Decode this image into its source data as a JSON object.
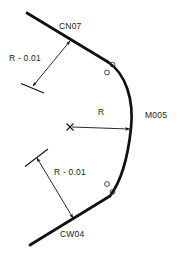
{
  "drawing": {
    "title": "tangent-arc-radius-dimension-diagram",
    "stroke_color": "#111111",
    "background_color": "#ffffff",
    "thick_stroke_width": 2.6,
    "thin_stroke_width": 0.9,
    "labels": {
      "upper_tangent_point": "CN07",
      "lower_tangent_point": "CW04",
      "arc_apex": "M005",
      "radius": "R",
      "radius_minus_upper": "R - 0.01",
      "radius_minus_lower": "R - 0.01"
    },
    "geometry": {
      "upper_line_start": [
        27,
        13
      ],
      "upper_line_end": [
        108,
        62
      ],
      "lower_line_start": [
        30,
        245
      ],
      "lower_line_end": [
        110,
        196
      ],
      "arc_apex_point": [
        131,
        128
      ],
      "arc_center_mark": [
        70,
        127
      ],
      "radius_arrow_start": [
        76,
        127
      ],
      "radius_arrow_end": [
        130,
        129
      ],
      "upper_leader_from": [
        70,
        40
      ],
      "upper_leader_to": [
        32,
        87
      ],
      "lower_leader_from": [
        73,
        219
      ],
      "lower_leader_to": [
        36,
        157
      ],
      "upper_witness_dash": [
        [
          21,
          84
        ],
        [
          44,
          93
        ]
      ],
      "lower_witness_dash": [
        [
          25,
          166
        ],
        [
          48,
          150
        ]
      ],
      "arc_markers_upper": [
        [
          112,
          64
        ],
        [
          107,
          72
        ]
      ],
      "arc_markers_lower": [
        [
          107,
          184
        ],
        [
          112,
          192
        ]
      ],
      "marker_radius": 2.4
    }
  }
}
